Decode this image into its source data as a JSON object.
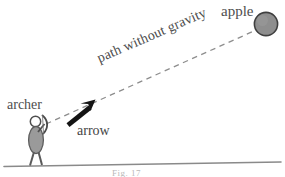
{
  "figure": {
    "caption": "Fig. 17",
    "background_color": "#ffffff"
  },
  "labels": {
    "apple": "apple",
    "archer": "archer",
    "arrow": "arrow",
    "path": "path without gravity"
  },
  "colors": {
    "text": "#4e4e4e",
    "dashed_line": "#8f8f8f",
    "arrow_fill": "#1a1a1a",
    "ground_line": "#8a8a8a",
    "apple_fill": "#8e8e8e",
    "apple_stroke": "#4a4a4a",
    "figure_fill": "#9a9a9a",
    "figure_stroke": "#5d5d5d"
  },
  "geometry": {
    "apple_center_x": 266,
    "apple_center_y": 24,
    "apple_radius": 12,
    "path_start_x": 46,
    "path_start_y": 124,
    "path_end_x": 254,
    "path_end_y": 31,
    "arrow_tail_x": 66,
    "arrow_tail_y": 123,
    "arrow_tip_x": 95,
    "arrow_tip_y": 100,
    "ground_left_x": 4,
    "ground_left_y": 166,
    "ground_right_x": 281,
    "ground_right_y": 162,
    "archer_x": 36,
    "archer_ground_y": 165
  }
}
